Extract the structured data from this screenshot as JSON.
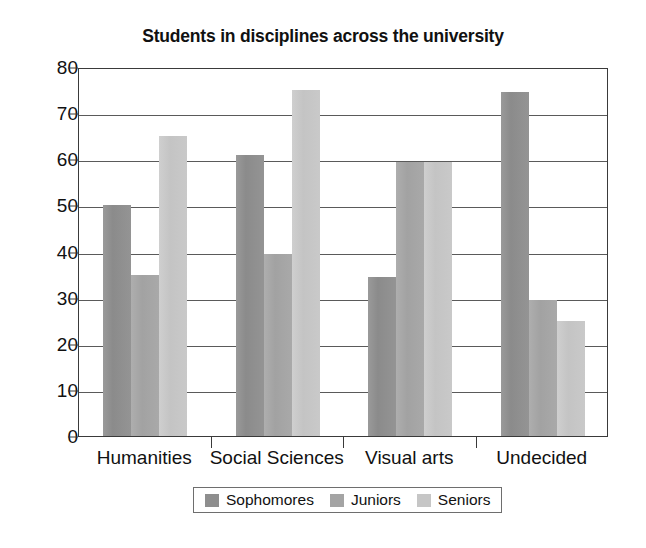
{
  "chart_data": {
    "type": "bar",
    "title": "Students in disciplines across the university",
    "xlabel": "",
    "ylabel": "",
    "categories": [
      "Humanities",
      "Social Sciences",
      "Visual arts",
      "Undecided"
    ],
    "series": [
      {
        "name": "Sophomores",
        "color": "#8e8e8e",
        "values": [
          50,
          61,
          34.5,
          74.5
        ]
      },
      {
        "name": "Juniors",
        "color": "#a4a4a4",
        "values": [
          35,
          39.5,
          59.5,
          29.5
        ]
      },
      {
        "name": "Seniors",
        "color": "#c6c6c6",
        "values": [
          65,
          75,
          59.5,
          25
        ]
      }
    ],
    "ylim": [
      0,
      80
    ],
    "yticks": [
      0,
      10,
      20,
      30,
      40,
      50,
      60,
      70,
      80
    ],
    "ytick_labels": [
      "0",
      "10",
      "20",
      "30",
      "40",
      "50",
      "60",
      "70",
      "80"
    ],
    "grid": true,
    "grid_axis": "y",
    "legend_position": "bottom",
    "bar_style": "grouped-contiguous"
  }
}
